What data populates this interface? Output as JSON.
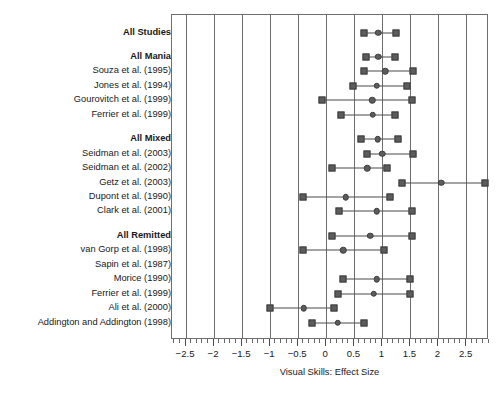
{
  "chart_data": {
    "type": "forest",
    "title": "",
    "xlabel": "Visual Skills: Effect Size",
    "ylabel": "",
    "xlim": [
      -2.75,
      2.9
    ],
    "xticks": [
      -2.5,
      -2,
      -1.5,
      -1,
      -0.5,
      0,
      0.5,
      1,
      1.5,
      2,
      2.5
    ],
    "xticklabels": [
      "−2.5",
      "−2",
      "−1.5",
      "−1",
      "−0.5",
      "0",
      "0.5",
      "1",
      "1.5",
      "2",
      "2.5"
    ],
    "minor_tick_step": 0.1,
    "grid": "vertical",
    "legend": "none",
    "marker_color": "#5c5c5c",
    "line_color": "#4a4a4a",
    "frame_color": "#6e6e6e",
    "rows": [
      {
        "label": "All Studies",
        "group": true,
        "spacer_before": 0,
        "estimate": 0.93,
        "lower": 0.67,
        "upper": 1.25
      },
      {
        "label": "All Mania",
        "group": true,
        "spacer_before": 1,
        "estimate": 0.93,
        "lower": 0.7,
        "upper": 1.23
      },
      {
        "label": "Souza et al. (1995)",
        "group": false,
        "spacer_before": 0,
        "estimate": 1.05,
        "lower": 0.68,
        "upper": 1.55
      },
      {
        "label": "Jones et al. (1994)",
        "group": false,
        "spacer_before": 0,
        "estimate": 0.9,
        "lower": 0.48,
        "upper": 1.43
      },
      {
        "label": "Gourovitch et al. (1999)",
        "group": false,
        "spacer_before": 0,
        "estimate": 0.82,
        "lower": -0.08,
        "upper": 1.52
      },
      {
        "label": "Ferrier et al. (1999)",
        "group": false,
        "spacer_before": 0,
        "estimate": 0.83,
        "lower": 0.27,
        "upper": 1.22
      },
      {
        "label": "All Mixed",
        "group": true,
        "spacer_before": 1,
        "estimate": 0.92,
        "lower": 0.62,
        "upper": 1.28
      },
      {
        "label": "Seidman et al. (2003)",
        "group": false,
        "spacer_before": 0,
        "estimate": 1.0,
        "lower": 0.73,
        "upper": 1.55
      },
      {
        "label": "Seidman et al. (2002)",
        "group": false,
        "spacer_before": 0,
        "estimate": 0.73,
        "lower": 0.1,
        "upper": 1.08
      },
      {
        "label": "Getz et al. (2003)",
        "group": false,
        "spacer_before": 0,
        "estimate": 2.05,
        "lower": 1.35,
        "upper": 2.82
      },
      {
        "label": "Dupont et al. (1990)",
        "group": false,
        "spacer_before": 0,
        "estimate": 0.35,
        "lower": -0.42,
        "upper": 1.14
      },
      {
        "label": "Clark et al. (2001)",
        "group": false,
        "spacer_before": 0,
        "estimate": 0.9,
        "lower": 0.22,
        "upper": 1.52
      },
      {
        "label": "All Remitted",
        "group": true,
        "spacer_before": 1,
        "estimate": 0.78,
        "lower": 0.1,
        "upper": 1.52
      },
      {
        "label": "van Gorp et al. (1998)",
        "group": false,
        "spacer_before": 0,
        "estimate": 0.3,
        "lower": -0.42,
        "upper": 1.02
      },
      {
        "label": "Sapin et al. (1987)",
        "group": false,
        "spacer_before": 0,
        "estimate": null,
        "lower": null,
        "upper": null
      },
      {
        "label": "Morice (1990)",
        "group": false,
        "spacer_before": 0,
        "estimate": 0.9,
        "lower": 0.3,
        "upper": 1.5
      },
      {
        "label": "Ferrier et al. (1999)",
        "group": false,
        "spacer_before": 0,
        "estimate": 0.85,
        "lower": 0.21,
        "upper": 1.5
      },
      {
        "label": "Ali et al. (2000)",
        "group": false,
        "spacer_before": 0,
        "estimate": -0.4,
        "lower": -1.0,
        "upper": 0.13
      },
      {
        "label": "Addington and Addington (1998)",
        "group": false,
        "spacer_before": 0,
        "estimate": 0.2,
        "lower": -0.25,
        "upper": 0.67
      }
    ]
  }
}
